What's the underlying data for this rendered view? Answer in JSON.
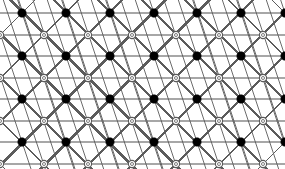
{
  "figure": {
    "width": 285,
    "height": 169,
    "background_color": "#ffffff"
  },
  "colors": {
    "horizontal_line": "#8a8a8a",
    "diagonal_line": "#4a4a4a",
    "steep_line": "#5a5a5a",
    "filled_node_fill": "#000000",
    "filled_node_stroke": "#000000",
    "open_node_fill": "#ffffff",
    "open_node_stroke": "#5a5a5a"
  },
  "geometry": {
    "origin_x": 22,
    "origin_y": 13,
    "column_spacing": 43.8,
    "row_spacing": 43.0,
    "half_column_offset": 21.9,
    "half_row_offset": 21.5,
    "columns": 7,
    "rows": 4,
    "filled_radius": 4.2,
    "open_radius": 3.6,
    "open_inner_radius": 1.5,
    "horizontal_line_width": 1.6,
    "diagonal_line_width": 0.9,
    "steep_line_width": 0.9
  },
  "chart_data": {
    "type": "scatter",
    "xlabel": "",
    "ylabel": "",
    "xlim": [
      0,
      285
    ],
    "ylim": [
      0,
      169
    ],
    "grid": false,
    "legend_position": "none",
    "series": [
      {
        "name": "filled-sublattice",
        "marker": "filled-circle",
        "color": "#000000",
        "points": [
          [
            22,
            13
          ],
          [
            66,
            13
          ],
          [
            110,
            13
          ],
          [
            154,
            13
          ],
          [
            197,
            13
          ],
          [
            241,
            13
          ],
          [
            285,
            13
          ],
          [
            22,
            56
          ],
          [
            66,
            56
          ],
          [
            110,
            56
          ],
          [
            154,
            56
          ],
          [
            197,
            56
          ],
          [
            241,
            56
          ],
          [
            285,
            56
          ],
          [
            22,
            99
          ],
          [
            66,
            99
          ],
          [
            110,
            99
          ],
          [
            154,
            99
          ],
          [
            197,
            99
          ],
          [
            241,
            99
          ],
          [
            285,
            99
          ],
          [
            22,
            142
          ],
          [
            66,
            142
          ],
          [
            110,
            142
          ],
          [
            154,
            142
          ],
          [
            197,
            142
          ],
          [
            241,
            142
          ],
          [
            285,
            142
          ]
        ]
      },
      {
        "name": "open-sublattice",
        "marker": "open-circle",
        "color": "#5a5a5a",
        "points": [
          [
            0,
            35
          ],
          [
            44,
            35
          ],
          [
            88,
            35
          ],
          [
            132,
            35
          ],
          [
            176,
            35
          ],
          [
            219,
            35
          ],
          [
            263,
            35
          ],
          [
            0,
            78
          ],
          [
            44,
            78
          ],
          [
            88,
            78
          ],
          [
            132,
            78
          ],
          [
            176,
            78
          ],
          [
            219,
            78
          ],
          [
            263,
            78
          ],
          [
            0,
            121
          ],
          [
            44,
            121
          ],
          [
            88,
            121
          ],
          [
            132,
            121
          ],
          [
            176,
            121
          ],
          [
            219,
            121
          ],
          [
            263,
            121
          ],
          [
            0,
            164
          ],
          [
            44,
            164
          ],
          [
            88,
            164
          ],
          [
            132,
            164
          ],
          [
            176,
            164
          ],
          [
            219,
            164
          ],
          [
            263,
            164
          ]
        ]
      }
    ],
    "edge_families": [
      {
        "name": "horizontal-rows-filled",
        "direction": "horizontal",
        "y_values": [
          13,
          56,
          99,
          142
        ],
        "color": "#8a8a8a"
      },
      {
        "name": "horizontal-rows-open",
        "direction": "horizontal",
        "y_values": [
          35,
          78,
          121,
          164
        ],
        "color": "#8a8a8a"
      },
      {
        "name": "diagonal-down-right",
        "slope": 1.0,
        "color": "#4a4a4a"
      },
      {
        "name": "diagonal-down-left",
        "slope": -1.0,
        "color": "#4a4a4a"
      },
      {
        "name": "steep-down-right",
        "slope": 3.0,
        "color": "#5a5a5a"
      }
    ]
  },
  "labels": {
    "figure_caption": "",
    "axis_ticks": []
  }
}
